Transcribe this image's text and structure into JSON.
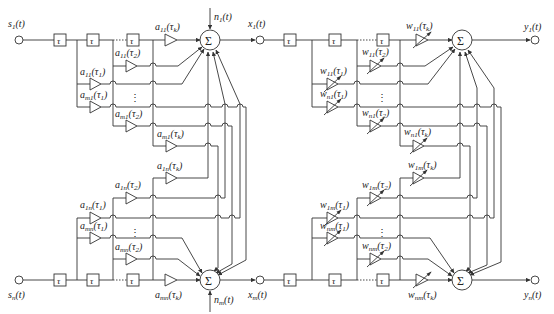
{
  "figure": {
    "type": "block-diagram",
    "left_panel": {
      "name": "mixing-system",
      "inputs": [
        "s1(t)",
        "sn(t)"
      ],
      "outputs": [
        "x1(t)",
        "xm(t)"
      ],
      "noise": [
        "n1(t)",
        "nm(t)"
      ],
      "delay_label": "τ",
      "sum_label": "Σ",
      "top_gains": [
        "a11(τk)",
        "a11(τ2)",
        "a11(τ1)",
        "am1(τ1)",
        "am1(τ2)",
        "am1(τk)"
      ],
      "bottom_gains": [
        "a1n(τk)",
        "a1n(τ2)",
        "a1n(τ1)",
        "amn(τ1)",
        "amn(τ2)",
        "amn(τk)"
      ],
      "ellipsis": "⋮"
    },
    "right_panel": {
      "name": "demixing-system",
      "inputs": [
        "x1(t)",
        "xm(t)"
      ],
      "outputs": [
        "y1(t)",
        "yn(t)"
      ],
      "delay_label": "τ",
      "sum_label": "Σ",
      "top_gains": [
        "w11(τk)",
        "w11(τ2)",
        "w11(τ1)",
        "wn1(τ1)",
        "wn1(τ2)",
        "wn1(τk)"
      ],
      "bottom_gains": [
        "w1m(τk)",
        "w1m(τ2)",
        "w1m(τ1)",
        "wnm(τ1)",
        "wnm(τ2)",
        "wnm(τk)"
      ],
      "ellipsis": "⋮"
    }
  }
}
